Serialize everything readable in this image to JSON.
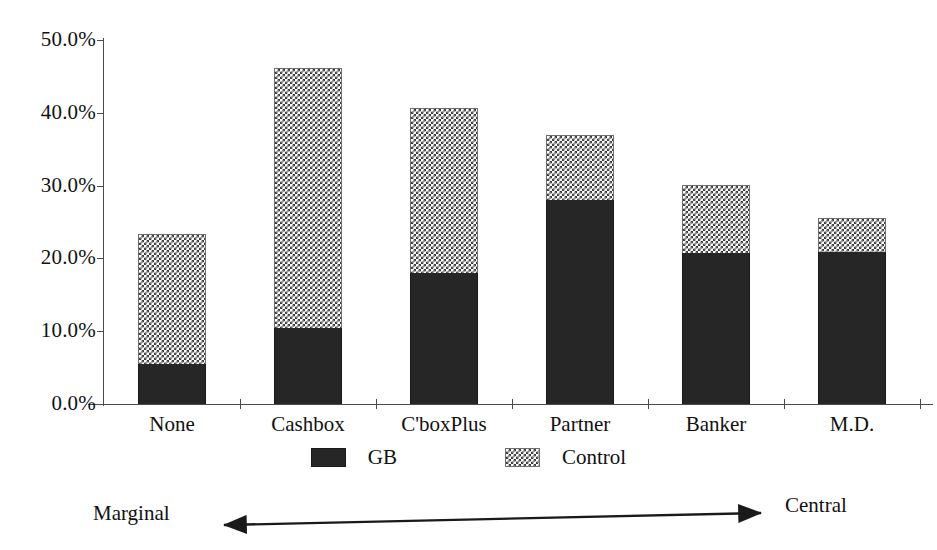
{
  "chart_data": {
    "type": "bar",
    "subtype": "stacked-vertical",
    "title": "",
    "xlabel": "",
    "ylabel": "",
    "categories": [
      "None",
      "Cashbox",
      "C'boxPlus",
      "Partner",
      "Banker",
      "M.D."
    ],
    "series": [
      {
        "name": "GB",
        "values": [
          5.5,
          10.4,
          18.0,
          28.0,
          20.7,
          20.9
        ]
      },
      {
        "name": "Control",
        "values": [
          17.9,
          35.8,
          22.7,
          9.0,
          9.4,
          4.6
        ]
      }
    ],
    "totals": [
      23.4,
      46.2,
      40.7,
      37.0,
      30.1,
      25.5
    ],
    "ylim": [
      0,
      50
    ],
    "ytick_values": [
      0,
      10,
      20,
      30,
      40,
      50
    ],
    "ytick_labels": [
      "0.0%",
      "10.0%",
      "20.0%",
      "30.0%",
      "40.0%",
      "50.0%"
    ],
    "grid": false,
    "legend_position": "bottom",
    "legend_entries": [
      "GB",
      "Control"
    ],
    "annotations": {
      "left_label": "Marginal",
      "right_label": "Central",
      "arrow": "double-headed-horizontal-arrow"
    },
    "colors": {
      "gb": "#262626",
      "control_pattern_ink": "#3d3d3d",
      "control_pattern_bg": "#ffffff",
      "axis": "#4a4a4a",
      "text": "#111111",
      "background": "#ffffff"
    }
  },
  "yaxis": {
    "ticks": [
      {
        "label": "50.0%",
        "value": 50
      },
      {
        "label": "40.0%",
        "value": 40
      },
      {
        "label": "30.0%",
        "value": 30
      },
      {
        "label": "20.0%",
        "value": 20
      },
      {
        "label": "10.0%",
        "value": 10
      },
      {
        "label": "0.0%",
        "value": 0
      }
    ]
  },
  "xaxis": {
    "labels": [
      "None",
      "Cashbox",
      "C'boxPlus",
      "Partner",
      "Banker",
      "M.D."
    ]
  },
  "legend": {
    "items": [
      {
        "label": "GB",
        "swatch": "solid-dark-swatch"
      },
      {
        "label": "Control",
        "swatch": "checkered-swatch"
      }
    ]
  },
  "annotation": {
    "left": "Marginal",
    "right": "Central"
  }
}
